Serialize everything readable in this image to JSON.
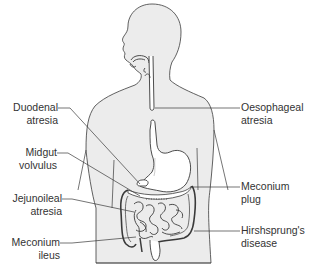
{
  "figure": {
    "colors": {
      "body_fill": "#ececec",
      "outline": "#3a3a3a",
      "text": "#333333",
      "background": "#ffffff"
    }
  },
  "labels": {
    "left": [
      {
        "id": "duodenal-atresia",
        "line1": "Duodenal",
        "line2": "atresia"
      },
      {
        "id": "midgut-volvulus",
        "line1": "Midgut",
        "line2": "volvulus"
      },
      {
        "id": "jejunoileal-atresia",
        "line1": "Jejunoileal",
        "line2": "atresia"
      },
      {
        "id": "meconium-ileus",
        "line1": "Meconium",
        "line2": "ileus"
      }
    ],
    "right": [
      {
        "id": "oesophageal-atresia",
        "line1": "Oesophageal",
        "line2": "atresia"
      },
      {
        "id": "meconium-plug",
        "line1": "Meconium",
        "line2": "plug"
      },
      {
        "id": "hirshsprungs-disease",
        "line1": "Hirshsprung's",
        "line2": "disease"
      }
    ]
  }
}
